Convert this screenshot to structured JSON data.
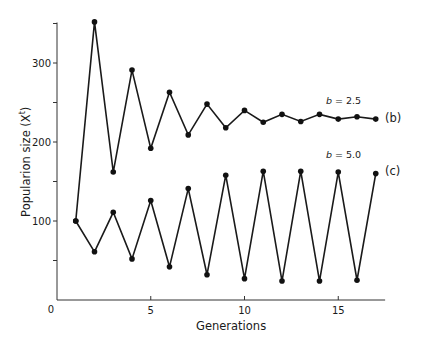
{
  "chart_data": {
    "type": "line",
    "title": "",
    "xlabel": "Generations",
    "ylabel": "Popularion size (X",
    "ylabel_superscript": "t",
    "ylabel_close": ")",
    "xlim": [
      0,
      17.5
    ],
    "ylim": [
      0,
      350
    ],
    "x_ticks": [
      0,
      5,
      10,
      15
    ],
    "x_tick_labels": [
      "0",
      "5",
      "10",
      "15"
    ],
    "y_ticks_major": [
      100,
      200,
      300
    ],
    "y_tick_labels": [
      "100",
      "200",
      "300"
    ],
    "y_ticks_minor": [
      50,
      150,
      250,
      350
    ],
    "origin_label": "0",
    "grid": false,
    "legend": "inline annotations at right end of each series",
    "x": [
      1,
      2,
      3,
      4,
      5,
      6,
      7,
      8,
      9,
      10,
      11,
      12,
      13,
      14,
      15,
      16,
      17
    ],
    "series": [
      {
        "name": "(b)",
        "annotation": "b = 2.5",
        "param_symbol": "b",
        "param_value": "= 2.5",
        "values": [
          100,
          352,
          162,
          291,
          192,
          263,
          209,
          248,
          218,
          240,
          225,
          235,
          226,
          235,
          229,
          232,
          229
        ]
      },
      {
        "name": "(c)",
        "annotation": "b = 5.0",
        "param_symbol": "b",
        "param_value": "= 5.0",
        "values": [
          100,
          61,
          111,
          52,
          126,
          42,
          141,
          32,
          158,
          27,
          163,
          24,
          163,
          24,
          162,
          25,
          160
        ]
      }
    ],
    "colors": {
      "line": "#1a1a1a",
      "marker": "#111111",
      "axis": "#333333"
    }
  }
}
